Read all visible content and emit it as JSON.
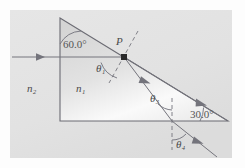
{
  "figure": {
    "background_color": "#fdfdfd",
    "panel_color": "#e3e3e3",
    "prism_fill_light": "#f2f2f2",
    "prism_fill_dark": "#d2d2d2",
    "line_color": "#6b6b73",
    "label_color": "#4a4a4a"
  },
  "labels": {
    "apex_angle": "60.0°",
    "base_angle": "30.0°",
    "point_p": "P",
    "theta1": "θ₁",
    "theta3": "θ₃",
    "theta4": "θ₄",
    "n1": "n₁",
    "n2": "n₂"
  },
  "geometry": {
    "prism_apex": [
      60,
      18
    ],
    "prism_bottom_left": [
      60,
      121
    ],
    "prism_bottom_right": [
      228,
      121
    ],
    "point_p": [
      124,
      57
    ],
    "incident_ray_start": [
      12,
      57
    ],
    "exit_point": [
      172,
      121
    ],
    "exit_ray_end": [
      217,
      157
    ]
  }
}
